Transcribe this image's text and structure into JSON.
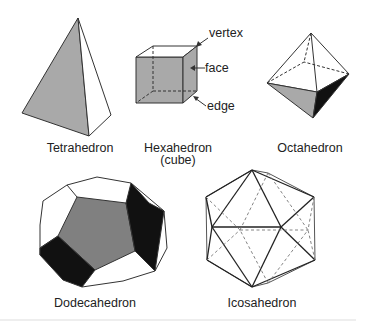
{
  "figure": {
    "solids": [
      {
        "id": "tetrahedron",
        "label": "Tetrahedron"
      },
      {
        "id": "hexahedron",
        "label": "Hexahedron",
        "sublabel": "(cube)"
      },
      {
        "id": "octahedron",
        "label": "Octahedron"
      },
      {
        "id": "dodecahedron",
        "label": "Dodecahedron"
      },
      {
        "id": "icosahedron",
        "label": "Icosahedron"
      }
    ],
    "annotations": {
      "vertex": "vertex",
      "face": "face",
      "edge": "edge"
    },
    "colors": {
      "gray_face": "#a9a9a9",
      "dark_face": "#111111",
      "white_face": "#ffffff",
      "line": "#333333"
    }
  }
}
